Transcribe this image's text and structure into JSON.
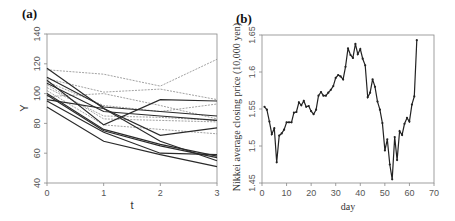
{
  "chart_data": [
    {
      "panel": "(a)",
      "type": "line",
      "title": "",
      "xlabel": "t",
      "ylabel": "Y",
      "xlim": [
        0,
        3
      ],
      "ylim": [
        40,
        140
      ],
      "xticks": [
        "0",
        "1",
        "2",
        "3"
      ],
      "yticks": [
        "40",
        "60",
        "80",
        "100",
        "120",
        "140"
      ],
      "grid": false,
      "legend": null,
      "x": [
        0,
        1,
        2,
        3
      ],
      "series": [
        {
          "name": "dashed-1",
          "style": "dashed",
          "values": [
            116,
            113,
            105,
            123
          ]
        },
        {
          "name": "dashed-2",
          "style": "dashed",
          "values": [
            110,
            101,
            103,
            96
          ]
        },
        {
          "name": "dashed-3",
          "style": "dashed",
          "values": [
            108,
            92,
            88,
            93
          ]
        },
        {
          "name": "dashed-4",
          "style": "dashed",
          "values": [
            104,
            85,
            84,
            82
          ]
        },
        {
          "name": "dashed-5",
          "style": "dashed",
          "values": [
            102,
            79,
            76,
            73
          ]
        },
        {
          "name": "dashed-6",
          "style": "dashed",
          "values": [
            98,
            100,
            92,
            83
          ]
        },
        {
          "name": "dashed-7",
          "style": "dashed",
          "values": [
            106,
            83,
            82,
            81
          ]
        },
        {
          "name": "solid-1",
          "style": "solid",
          "values": [
            117,
            90,
            72,
            77
          ]
        },
        {
          "name": "solid-2",
          "style": "solid",
          "values": [
            111,
            91,
            88,
            85
          ]
        },
        {
          "name": "solid-3",
          "style": "solid",
          "values": [
            109,
            79,
            96,
            95
          ]
        },
        {
          "name": "solid-4",
          "style": "solid",
          "values": [
            107,
            88,
            85,
            82
          ]
        },
        {
          "name": "solid-5",
          "style": "solid",
          "values": [
            100,
            76,
            66,
            58
          ]
        },
        {
          "name": "solid-6",
          "style": "solid",
          "values": [
            99,
            75,
            65,
            57
          ]
        },
        {
          "name": "solid-7",
          "style": "solid",
          "values": [
            96,
            90,
            68,
            55
          ]
        },
        {
          "name": "solid-8",
          "style": "solid",
          "values": [
            95,
            74,
            60,
            59
          ]
        },
        {
          "name": "solid-9",
          "style": "solid",
          "values": [
            91,
            68,
            59,
            51
          ]
        }
      ]
    },
    {
      "panel": "(b)",
      "type": "line",
      "title": "",
      "xlabel": "day",
      "ylabel": "Nikkei average closing price (10,000 yen)",
      "xlim": [
        0,
        70
      ],
      "ylim": [
        1.45,
        1.65
      ],
      "xticks": [
        "0",
        "10",
        "20",
        "30",
        "40",
        "50",
        "60",
        "70"
      ],
      "yticks": [
        "1.45",
        "1.5",
        "1.55",
        "1.6",
        "1.65"
      ],
      "grid": false,
      "legend": null,
      "markers": true,
      "x": [
        1,
        2,
        3,
        4,
        5,
        6,
        7,
        8,
        9,
        10,
        11,
        12,
        13,
        14,
        15,
        16,
        17,
        18,
        19,
        20,
        21,
        22,
        23,
        24,
        25,
        26,
        27,
        28,
        29,
        30,
        31,
        32,
        33,
        34,
        35,
        36,
        37,
        38,
        39,
        40,
        41,
        42,
        43,
        44,
        45,
        46,
        47,
        48,
        49,
        50,
        51,
        52,
        53,
        54,
        55,
        56,
        57,
        58,
        59,
        60,
        61,
        62,
        63
      ],
      "values": [
        1.553,
        1.549,
        1.533,
        1.516,
        1.524,
        1.478,
        1.514,
        1.517,
        1.522,
        1.532,
        1.532,
        1.532,
        1.545,
        1.546,
        1.559,
        1.555,
        1.561,
        1.553,
        1.554,
        1.547,
        1.543,
        1.549,
        1.568,
        1.573,
        1.568,
        1.568,
        1.572,
        1.576,
        1.581,
        1.592,
        1.596,
        1.594,
        1.59,
        1.607,
        1.632,
        1.623,
        1.619,
        1.638,
        1.624,
        1.631,
        1.618,
        1.609,
        1.566,
        1.572,
        1.59,
        1.58,
        1.56,
        1.549,
        1.531,
        1.494,
        1.509,
        1.475,
        1.455,
        1.512,
        1.481,
        1.52,
        1.515,
        1.53,
        1.538,
        1.533,
        1.556,
        1.567,
        1.643
      ]
    }
  ],
  "panels": {
    "a": {
      "label": "(a)",
      "xlabel": "t",
      "ylabel": "Y"
    },
    "b": {
      "label": "(b)",
      "xlabel": "day",
      "ylabel": "Nikkei average closing price (10,000 yen)"
    }
  }
}
